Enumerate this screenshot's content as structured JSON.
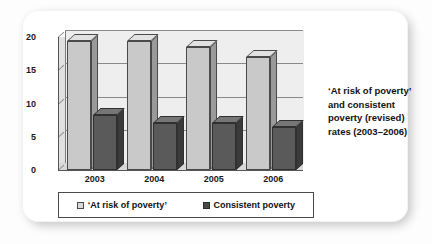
{
  "caption": {
    "text": "‘At risk of poverty’ and consistent poverty (revised) rates (2003–2006)"
  },
  "legend": {
    "items": [
      {
        "label": "‘At risk of poverty’",
        "swatch": "light",
        "color": "#d8d8d8"
      },
      {
        "label": "Consistent poverty",
        "swatch": "dark",
        "color": "#4a4a4a"
      }
    ]
  },
  "colors": {
    "series_light_face": "#c9c9c9",
    "series_light_top": "#e2e2e2",
    "series_light_side": "#9a9a9a",
    "series_dark_face": "#5a5a5a",
    "series_dark_top": "#767676",
    "series_dark_side": "#3a3a3a",
    "plot_background": "#eeeeee",
    "gridline": "#8a8a8a",
    "card_background": "#ffffff"
  },
  "chart_data": {
    "type": "bar",
    "title": "‘At risk of poverty’ and consistent poverty (revised) rates (2003–2006)",
    "xlabel": "",
    "ylabel": "",
    "categories": [
      "2003",
      "2004",
      "2005",
      "2006"
    ],
    "series": [
      {
        "name": "‘At risk of poverty’",
        "values": [
          19.4,
          19.4,
          18.5,
          17.0
        ]
      },
      {
        "name": "Consistent poverty",
        "values": [
          8.2,
          7.0,
          7.0,
          6.5
        ]
      }
    ],
    "ylim": [
      0,
      20
    ],
    "yticks": [
      0,
      5,
      10,
      15,
      20
    ],
    "ytick_labels": [
      "0",
      "5",
      "10",
      "15",
      "20"
    ],
    "grid": true,
    "legend_position": "bottom",
    "three_d": true
  }
}
